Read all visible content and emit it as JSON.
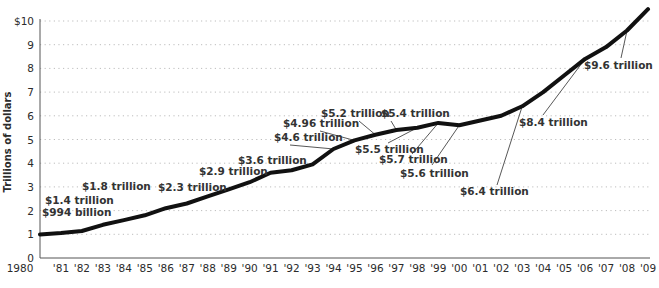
{
  "chart_data": {
    "type": "line",
    "title": "",
    "xlabel": "",
    "ylabel": "Trillions of dollars",
    "ylim": [
      0,
      10
    ],
    "grid": true,
    "legend": null,
    "y_ticks": [
      "0",
      "1",
      "2",
      "3",
      "4",
      "5",
      "6",
      "7",
      "8",
      "9",
      "$10"
    ],
    "x_ticks": [
      "1980",
      "'81",
      "'82",
      "'83",
      "'84",
      "'85",
      "'86",
      "'87",
      "'88",
      "'89",
      "'90",
      "'91",
      "'92",
      "'93",
      "'94",
      "'95",
      "'96",
      "'97",
      "'98",
      "'99",
      "'00",
      "'01",
      "'02",
      "'03",
      "'04",
      "'05",
      "'06",
      "'07",
      "'08",
      "'09"
    ],
    "x": [
      1980,
      1981,
      1982,
      1983,
      1984,
      1985,
      1986,
      1987,
      1988,
      1989,
      1990,
      1991,
      1992,
      1993,
      1994,
      1995,
      1996,
      1997,
      1998,
      1999,
      2000,
      2001,
      2002,
      2003,
      2004,
      2005,
      2006,
      2007,
      2008,
      2009
    ],
    "series": [
      {
        "name": "Debt",
        "values": [
          0.994,
          1.05,
          1.14,
          1.4,
          1.6,
          1.8,
          2.1,
          2.3,
          2.6,
          2.9,
          3.2,
          3.6,
          3.7,
          3.95,
          4.6,
          4.96,
          5.2,
          5.4,
          5.5,
          5.7,
          5.6,
          5.8,
          6.0,
          6.4,
          7.0,
          7.7,
          8.4,
          8.9,
          9.6,
          10.5
        ]
      }
    ],
    "annotations": [
      {
        "label": "$994 billion",
        "year": 1980,
        "value": 0.994
      },
      {
        "label": "$1.4 trillion",
        "year": 1983,
        "value": 1.4
      },
      {
        "label": "$1.8 trillion",
        "year": 1985,
        "value": 1.8
      },
      {
        "label": "$2.3 trillion",
        "year": 1987,
        "value": 2.3
      },
      {
        "label": "$2.9 trillion",
        "year": 1989,
        "value": 2.9
      },
      {
        "label": "$3.6 trillion",
        "year": 1991,
        "value": 3.6
      },
      {
        "label": "$4.6 trillion",
        "year": 1994,
        "value": 4.6
      },
      {
        "label": "$4.96 trillion",
        "year": 1995,
        "value": 4.96
      },
      {
        "label": "$5.2 trillion",
        "year": 1996,
        "value": 5.2
      },
      {
        "label": "$5.4 trillion",
        "year": 1997,
        "value": 5.4
      },
      {
        "label": "$5.5 trillion",
        "year": 1998,
        "value": 5.5
      },
      {
        "label": "$5.7 trillion",
        "year": 1999,
        "value": 5.7
      },
      {
        "label": "$5.6 trillion",
        "year": 2000,
        "value": 5.6
      },
      {
        "label": "$6.4 trillion",
        "year": 2003,
        "value": 6.4
      },
      {
        "label": "$8.4 trillion",
        "year": 2006,
        "value": 8.4
      },
      {
        "label": "$9.6 trillion",
        "year": 2008,
        "value": 9.6
      }
    ],
    "colors": {
      "line": "#111111",
      "grid": "#bdbdbd",
      "axis": "#555555",
      "text": "#2b2b2b",
      "leader": "#444444"
    }
  }
}
